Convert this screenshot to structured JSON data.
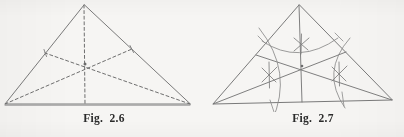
{
  "page": {
    "background_color": "#f6f5f3",
    "ink_color": "#6b6b6b",
    "caption_color": "#2b2b2b",
    "width": 404,
    "height": 137
  },
  "figures": [
    {
      "id": "fig-2-6",
      "caption": "Fig.  2.6",
      "description": "Triangle with three dashed medians meeting at the centroid",
      "line_style": "dashed",
      "geometry": {
        "apex": [
          84,
          5
        ],
        "left_vertex": [
          5,
          104
        ],
        "right_vertex": [
          190,
          104
        ],
        "centroid": [
          85,
          64
        ],
        "midpoint_left_side": [
          45,
          53
        ],
        "midpoint_right_side": [
          132,
          49
        ],
        "midpoint_base": [
          85,
          104
        ]
      },
      "elements": {
        "triangle_label": "triangle-outline",
        "median_a_label": "median-from-apex",
        "median_b_label": "median-from-left-vertex",
        "median_c_label": "median-from-right-vertex",
        "centroid_label": "centroid-point"
      }
    },
    {
      "id": "fig-2-7",
      "caption": "Fig.  2.7",
      "description": "Same triangle with solid medians plus compass construction arcs and crossing marks at each side midpoint",
      "line_style": "solid",
      "geometry": {
        "apex": [
          97,
          5
        ],
        "left_vertex": [
          11,
          104
        ],
        "right_vertex": [
          190,
          100
        ],
        "centroid": [
          100,
          66
        ],
        "midpoint_left_side": [
          54,
          55
        ],
        "midpoint_right_side": [
          144,
          52
        ],
        "midpoint_base": [
          100,
          102
        ]
      },
      "elements": {
        "triangle_label": "triangle-outline",
        "arc_apex_label": "compass-arc-from-apex",
        "arc_left_label": "compass-arc-from-left-vertex",
        "arc_right_label": "compass-arc-from-right-vertex",
        "cross_top_label": "bisector-cross-mark-top",
        "cross_left_label": "bisector-cross-mark-left",
        "cross_right_label": "bisector-cross-mark-right"
      }
    }
  ]
}
